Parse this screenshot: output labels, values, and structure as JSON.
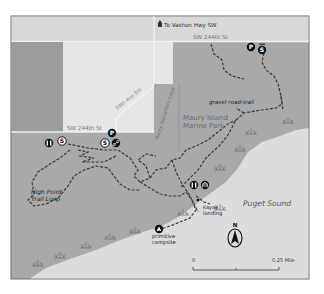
{
  "map": {
    "colors": {
      "background": "#ffffff",
      "frame": "#6e6e6e",
      "land_park": "#a9a9a9",
      "land_private": "#e6e6e6",
      "land_strip": "#9c9c9c",
      "top_road_band": "#d8d8d8",
      "water": "#dcdcdc",
      "trail": "#3a3a3a",
      "road": "#f5f5f5",
      "icon_fill": "#111111",
      "text_dark": "#222222",
      "text_light": "#6a6a6a"
    },
    "labels": {
      "to_vashon": "To Vashon Hwy SW",
      "sw_244th_top": "SW 244th St",
      "sw_244th_left": "SW 244th St",
      "ave_59th": "59th Ave SW",
      "creek": "Maury Island Park Creek",
      "park_name_line1": "Maury Island",
      "park_name_line2": "Marine Park",
      "gravel_road_trail": "gravel road-trail",
      "high_point_line1": "High Point",
      "high_point_line2": "Trail Loop",
      "kayak_line1": "kayak",
      "kayak_line2": "landing",
      "campsite_line1": "primitive",
      "campsite_line2": "campsite",
      "water_name": "Puget Sound"
    },
    "icons": {
      "parking": "P",
      "trailhead": "S",
      "restroom": "restroom",
      "picnic": "picnic",
      "bike": "bike",
      "campsite": "tent"
    },
    "north_arrow": {
      "label": "N"
    },
    "scale_bar": {
      "start": "0",
      "end": "0.25 Mile"
    }
  }
}
